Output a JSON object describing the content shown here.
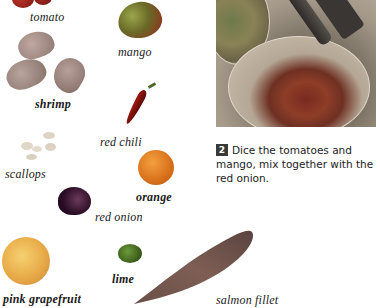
{
  "ingredients": [
    {
      "id": "tomato",
      "label": "tomato",
      "color": "#8c1e14"
    },
    {
      "id": "mango",
      "label": "mango",
      "color": "#5a7a2a"
    },
    {
      "id": "shrimp",
      "label": "shrimp",
      "color": "#9c8a86"
    },
    {
      "id": "red_chili",
      "label": "red chili",
      "color": "#8e1810"
    },
    {
      "id": "scallops",
      "label": "scallops",
      "color": "#e2d6c4"
    },
    {
      "id": "orange",
      "label": "orange",
      "color": "#e0781e"
    },
    {
      "id": "red_onion",
      "label": "red onion",
      "color": "#3a1838"
    },
    {
      "id": "pink_grapefruit",
      "label": "pink grapefruit",
      "color": "#e6b04a"
    },
    {
      "id": "lime",
      "label": "lime",
      "color": "#3f6a1e"
    },
    {
      "id": "salmon_fillet",
      "label": "salmon fillet",
      "color": "#7a5a50"
    }
  ],
  "step": {
    "number": "2",
    "text": "Dice the tomatoes and mango, mix together with the red onion."
  }
}
